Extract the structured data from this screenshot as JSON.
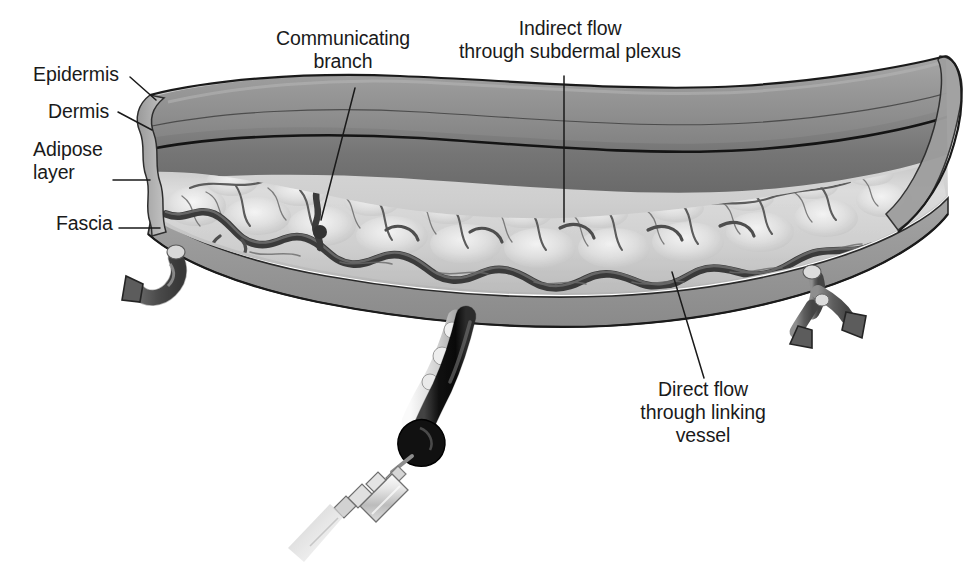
{
  "figure": {
    "name": "skin-flap-vascular-anatomy-diagram",
    "background_color": "#ffffff",
    "ink_color": "#1a1a1a"
  },
  "labels": {
    "epidermis": "Epidermis",
    "dermis": "Dermis",
    "adipose": "Adipose\nlayer",
    "fascia": "Fascia",
    "communicating_branch": "Communicating\nbranch",
    "indirect_flow": "Indirect flow\nthrough subdermal plexus",
    "direct_flow": "Direct flow\nthrough linking\nvessel"
  },
  "structures": {
    "epidermis_layer": "epidermis-layer",
    "dermis_layer": "dermis-layer",
    "adipose_layer": "adipose-layer",
    "fascia_layer": "fascia-layer",
    "subdermal_plexus": "subdermal-plexus",
    "linking_vessel": "linking-vessel",
    "communicating_branch_vessel": "communicating-branch-vessel",
    "perforator_pedicle": "perforator-pedicle",
    "left_vessel_stump": "left-vessel-stump",
    "right_vessel_stump": "right-vessel-stump",
    "syringe": "syringe"
  },
  "palette": {
    "outline": "#1a1a1a",
    "epidermis_fill": "#8f8f8f",
    "dermis_fill": "#7b7b7b",
    "adipose_fill": "#cfcfcf",
    "adipose_highlight": "#f2f2f2",
    "fascia_fill": "#a6a6a6",
    "vessel_dark": "#4a4a4a",
    "vessel_mid": "#6e6e6e",
    "pedicle_dark": "#1c1c1c",
    "syringe_light": "#e8e8e8"
  }
}
